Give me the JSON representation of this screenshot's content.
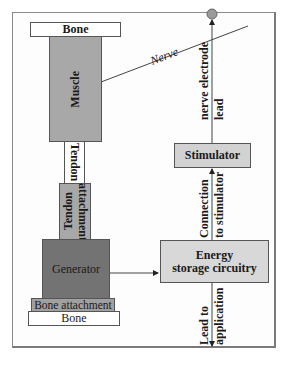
{
  "diagram": {
    "type": "block-diagram",
    "blocks": {
      "bone_top": "Bone",
      "muscle": "Muscle",
      "tendon": "Tendon",
      "tendon_attachment_line1": "Tendon",
      "tendon_attachment_line2": "attachment",
      "generator": "Generator",
      "bone_attachment": "Bone attachment",
      "bone_bottom": "Bone",
      "stimulator": "Stimulator",
      "energy_line1": "Energy",
      "energy_line2": "storage circuitry"
    },
    "labels": {
      "nerve": "Nerve",
      "nerve_lead_line1": "nerve electrode",
      "nerve_lead_line2": "lead",
      "connection_line1": "Connection",
      "connection_line2": "to stimulator",
      "lead_app_line1": "Lead to",
      "lead_app_line2": "application"
    },
    "connections": [
      {
        "from": "muscle",
        "to": "nerve-electrode",
        "kind": "nerve"
      },
      {
        "from": "stimulator",
        "to": "nerve-electrode",
        "kind": "arrow",
        "label": "nerve electrode lead"
      },
      {
        "from": "energy-storage-circuitry",
        "to": "stimulator",
        "kind": "arrow",
        "label": "Connection to stimulator"
      },
      {
        "from": "generator",
        "to": "energy-storage-circuitry",
        "kind": "arrow"
      },
      {
        "from": "energy-storage-circuitry",
        "to": "application",
        "kind": "arrow",
        "label": "Lead to application"
      }
    ],
    "colors": {
      "muscle": "#a8a8a8",
      "generator": "#737373",
      "stimulator": "#d2d2d2",
      "energy": "#d8d8d8",
      "electrode": "#9a9a9a"
    }
  }
}
